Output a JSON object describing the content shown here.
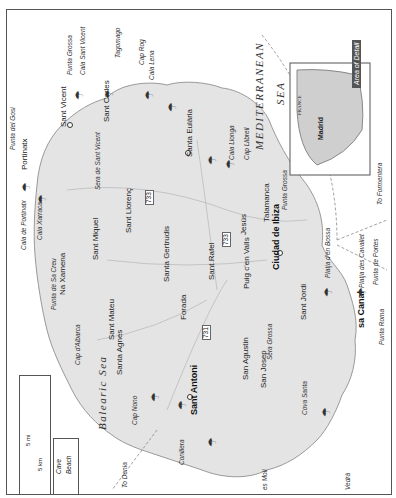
{
  "title": "Ibiza",
  "sea_labels": {
    "mediterranean": "MEDITERRANEAN",
    "sea": "SEA",
    "balearic": "Balearic Sea"
  },
  "inset": {
    "area_label": "Area of Detail",
    "france": "FRANCE",
    "spain": "SPAIN",
    "portugal": "PORTUGAL",
    "madrid": "Madrid"
  },
  "legend": {
    "cave": "Cave",
    "beach": "Beach",
    "scale_mi": "5 mi",
    "scale_km": "5 km",
    "zero": "0"
  },
  "roads": [
    "733",
    "733",
    "731"
  ],
  "towns": {
    "sant_vicent": "Sant Vicent",
    "sant_joan": "Sant\nJoan",
    "portinatx": "Portinatx",
    "sant_carles": "Sant Carles",
    "santa_eularia": "Santa Eulària",
    "port_sant_miquel": "Port de\nSant Miquel",
    "sant_miquel": "Sant Miquel",
    "sant_llorenc": "Sant Llorenç",
    "na_xamena": "Na Xamena",
    "santa_gertrudis": "Santa Gertrudis",
    "sant_rafel": "Sant Rafel",
    "jesus": "Jesús",
    "talamanca": "Talamanca",
    "puig": "Puig c'en Valls",
    "ciudad": "Ciudad de Ibiza",
    "sant_mateu": "Sant Mateu",
    "forada": "Forada",
    "santa_agnes": "Santa Agnes",
    "sant_antoni": "Sant Antoni",
    "port_torrent": "Port d'ei\nTorrent",
    "san_agustin": "San Agustin",
    "san_josep": "San Josep",
    "sant_jordi": "Sant Jordi",
    "sa_canal": "sa Canal"
  },
  "features": {
    "punta_grossa_n": "Punta Grossa",
    "cala_sant_vicent": "Cala Sant Vicent",
    "platja_figueral": "Platja de\nFigueral",
    "tagomago": "Tagomago",
    "cap_rog": "Cap Rog",
    "cala_lena": "Cala Lena",
    "platja_canar": "Platja\ndes Canar",
    "to_palma": "To Palma,\nBarcelona",
    "punta_gosi": "Punta del Gosi",
    "platja_sta_eularia": "Platja de\nSanta Eulària",
    "cala_llonga": "Cala Llonga",
    "cap_llibrell": "Cap Llibrell",
    "sera_sant_vicent": "Sera de Sant Vicent",
    "cala_portinatx": "Cala de Portinatx",
    "cala_xarraca": "Cala Xarraca",
    "sera_balanzat": "Sera de Balanzat",
    "punta_grossa_e": "Punta Grossa",
    "to_formentera": "To Formentera",
    "punta_sa_creu": "Punta de Sa Creu",
    "cap_albarca": "Cap d'Albarca",
    "platja_bossa": "Platja d'en Bossa",
    "platja_cavallet": "Platja des Cavallet",
    "punta_portes": "Punta de Portes",
    "to_valencia": "To Valencia\n/ Alicante",
    "sera_grossa": "Sera Grossa",
    "cap_nono": "Cap Nono",
    "cala_salada": "Cala\nSalada",
    "cala_gracio": "Cala\nGració",
    "conillera": "Conillera",
    "cala_bassa": "Cala\nBassa",
    "cala_conta": "Cala\nConta",
    "cala_tarida": "Cala\nTarida",
    "es_moli": "es Moli",
    "cala_vedella": "Cala\nVedella",
    "sera_san_jose": "Sera de San Jose",
    "cova_santa": "Cova Santa",
    "cala_cubells": "Cala d'es\nCubells",
    "cap_llentrisca": "Cap\nLlentrisca",
    "vedra": "Vedrà",
    "punta_roma": "Punta Roma",
    "to_denia": "To Denia"
  },
  "colors": {
    "land": "#e4e4e4",
    "sea": "#ffffff",
    "border": "#555555",
    "inset_label": "#555555"
  }
}
